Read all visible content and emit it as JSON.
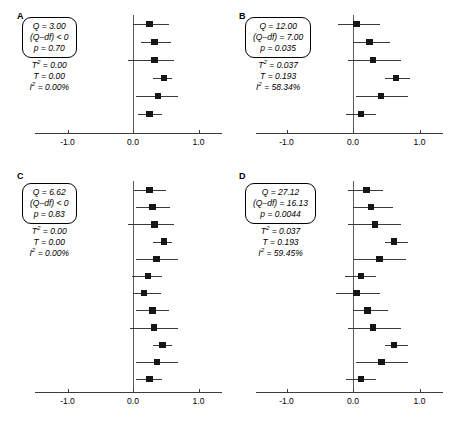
{
  "figure": {
    "type": "forest-plot-grid",
    "panel_count": 4,
    "background": "#ffffff",
    "marker_color": "#161616",
    "line_color": "#3a3a3a",
    "axis_color": "#3d3d3d",
    "zero_line_color": "#5b5b5b"
  },
  "axis": {
    "ticks": [
      "-1.0",
      "0.0",
      "1.0"
    ],
    "tick_values": [
      -1.0,
      0.0,
      1.0
    ],
    "xlim": [
      -1.45,
      1.4
    ]
  },
  "panels": [
    {
      "letter": "A",
      "stats_boxed": [
        "Q = 3.00",
        "(Q–df) < 0",
        "p = 0.70"
      ],
      "stats_unboxed": [
        "T² = 0.00",
        "T = 0.00",
        "I² = 0.00%"
      ],
      "stats": {
        "Q": "3.00",
        "Q_minus_df": "< 0",
        "p": "0.70",
        "T2": "0.00",
        "T": "0.00",
        "I2": "0.00%"
      },
      "n_studies": 6
    },
    {
      "letter": "B",
      "stats_boxed": [
        "Q = 12.00",
        "(Q–df) = 7.00",
        "p = 0.035"
      ],
      "stats_unboxed": [
        "T² = 0.037",
        "T = 0.193",
        "I² = 58.34%"
      ],
      "stats": {
        "Q": "12.00",
        "Q_minus_df": "7.00",
        "p": "0.035",
        "T2": "0.037",
        "T": "0.193",
        "I2": "58.34%"
      },
      "n_studies": 6
    },
    {
      "letter": "C",
      "stats_boxed": [
        "Q = 6.62",
        "(Q–df) < 0",
        "p = 0.83"
      ],
      "stats_unboxed": [
        "T² = 0.00",
        "T = 0.00",
        "I² = 0.00%"
      ],
      "stats": {
        "Q": "6.62",
        "Q_minus_df": "< 0",
        "p": "0.83",
        "T2": "0.00",
        "T": "0.00",
        "I2": "0.00%"
      },
      "n_studies": 12
    },
    {
      "letter": "D",
      "stats_boxed": [
        "Q = 27.12",
        "(Q–df) = 16.13",
        "p = 0.0044"
      ],
      "stats_unboxed": [
        "T² = 0.037",
        "T = 0.193",
        "I² = 59.45%"
      ],
      "stats": {
        "Q": "27.12",
        "Q_minus_df": "16.13",
        "p": "0.0044",
        "T2": "0.037",
        "T": "0.193",
        "I2": "59.45%"
      },
      "n_studies": 12
    }
  ],
  "chart_data": [
    {
      "type": "forest",
      "panel": "A",
      "title": "A",
      "xlabel": "",
      "ylabel": "",
      "xlim": [
        -1.45,
        1.4
      ],
      "xticks": [
        -1.0,
        0.0,
        1.0
      ],
      "xticklabels": [
        "-1.0",
        "0.0",
        "1.0"
      ],
      "grid": false,
      "reference_line": 0.0,
      "effects": [
        0.25,
        0.33,
        0.33,
        0.47,
        0.38,
        0.25
      ],
      "ci_low": [
        0.0,
        0.12,
        -0.08,
        0.3,
        0.05,
        0.08
      ],
      "ci_high": [
        0.55,
        0.58,
        0.62,
        0.6,
        0.68,
        0.45
      ]
    },
    {
      "type": "forest",
      "panel": "B",
      "title": "B",
      "xlabel": "",
      "ylabel": "",
      "xlim": [
        -1.45,
        1.4
      ],
      "xticks": [
        -1.0,
        0.0,
        1.0
      ],
      "xticklabels": [
        "-1.0",
        "0.0",
        "1.0"
      ],
      "grid": false,
      "reference_line": 0.0,
      "effects": [
        0.05,
        0.25,
        0.3,
        0.65,
        0.42,
        0.12
      ],
      "ci_low": [
        -0.22,
        0.0,
        -0.08,
        0.48,
        0.05,
        -0.1
      ],
      "ci_high": [
        0.4,
        0.55,
        0.72,
        0.85,
        0.82,
        0.35
      ]
    },
    {
      "type": "forest",
      "panel": "C",
      "title": "C",
      "xlabel": "",
      "ylabel": "",
      "xlim": [
        -1.45,
        1.4
      ],
      "xticks": [
        -1.0,
        0.0,
        1.0
      ],
      "xticklabels": [
        "-1.0",
        "0.0",
        "1.0"
      ],
      "grid": false,
      "reference_line": 0.0,
      "effects": [
        0.25,
        0.3,
        0.33,
        0.47,
        0.36,
        0.23,
        0.17,
        0.3,
        0.32,
        0.45,
        0.37,
        0.25
      ],
      "ci_low": [
        0.02,
        0.05,
        -0.08,
        0.3,
        0.05,
        -0.02,
        0.0,
        0.05,
        -0.05,
        0.3,
        0.05,
        0.05
      ],
      "ci_high": [
        0.5,
        0.57,
        0.62,
        0.6,
        0.68,
        0.45,
        0.42,
        0.55,
        0.68,
        0.6,
        0.68,
        0.45
      ]
    },
    {
      "type": "forest",
      "panel": "D",
      "title": "D",
      "xlabel": "",
      "ylabel": "",
      "xlim": [
        -1.45,
        1.4
      ],
      "xticks": [
        -1.0,
        0.0,
        1.0
      ],
      "xticklabels": [
        "-1.0",
        "0.0",
        "1.0"
      ],
      "grid": false,
      "reference_line": 0.0,
      "effects": [
        0.2,
        0.27,
        0.33,
        0.62,
        0.4,
        0.12,
        0.05,
        0.22,
        0.3,
        0.62,
        0.43,
        0.12
      ],
      "ci_low": [
        -0.08,
        0.0,
        -0.08,
        0.48,
        0.02,
        -0.12,
        -0.25,
        0.0,
        -0.08,
        0.48,
        0.05,
        -0.1
      ],
      "ci_high": [
        0.45,
        0.6,
        0.72,
        0.82,
        0.8,
        0.35,
        0.4,
        0.52,
        0.72,
        0.82,
        0.82,
        0.35
      ]
    }
  ]
}
